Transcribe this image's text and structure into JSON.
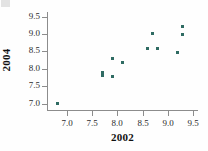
{
  "chart_data": {
    "type": "scatter",
    "title": "",
    "xlabel": "2002",
    "ylabel": "2004",
    "xlim": [
      6.6,
      9.6
    ],
    "ylim": [
      6.82,
      9.63
    ],
    "xticks": [
      7.0,
      7.5,
      8.0,
      8.5,
      9.0,
      9.5
    ],
    "yticks": [
      7.0,
      7.5,
      8.0,
      8.5,
      9.0,
      9.5
    ],
    "xticklabels": [
      "7.0",
      "7.5",
      "8.0",
      "8.5",
      "9.0",
      "9.5"
    ],
    "yticklabels": [
      "7.0",
      "7.5",
      "8.0",
      "8.5",
      "9.0",
      "9.5"
    ],
    "grid": false,
    "legend": false,
    "marker_color": "#2f6b63",
    "axis_color": "#8c8c8c",
    "points": [
      {
        "x": 6.8,
        "y": 7.0
      },
      {
        "x": 7.7,
        "y": 7.9
      },
      {
        "x": 7.7,
        "y": 7.8
      },
      {
        "x": 7.9,
        "y": 8.3
      },
      {
        "x": 7.9,
        "y": 7.78
      },
      {
        "x": 8.1,
        "y": 8.18
      },
      {
        "x": 8.6,
        "y": 8.58
      },
      {
        "x": 8.7,
        "y": 9.0
      },
      {
        "x": 8.8,
        "y": 8.58
      },
      {
        "x": 9.2,
        "y": 8.48
      },
      {
        "x": 9.3,
        "y": 9.2
      },
      {
        "x": 9.3,
        "y": 8.98
      }
    ]
  }
}
